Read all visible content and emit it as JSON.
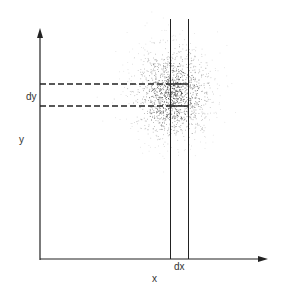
{
  "diagram": {
    "labels": {
      "y_axis": "y",
      "x_axis": "x",
      "dy": "dy",
      "dx": "dx"
    },
    "colors": {
      "ink": "#222222",
      "background": "#ffffff"
    },
    "scatter": {
      "center_x": 172,
      "center_y": 93,
      "spread_x": 20,
      "spread_y": 24,
      "count": 1400
    }
  }
}
